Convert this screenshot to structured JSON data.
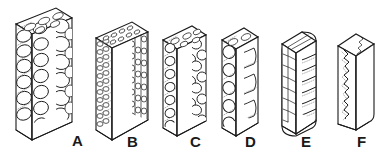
{
  "figure": {
    "type": "line-drawing-diagram",
    "background_color": "#ffffff",
    "ink_color": "#1a1a1a",
    "stipple_color": "#555555",
    "specimen_count": 6,
    "view": "isometric block"
  },
  "labels": [
    {
      "text": "A",
      "x": 72,
      "y": 133
    },
    {
      "text": "B",
      "x": 127,
      "y": 134
    },
    {
      "text": "C",
      "x": 190,
      "y": 134
    },
    {
      "text": "D",
      "x": 245,
      "y": 134
    },
    {
      "text": "E",
      "x": 301,
      "y": 134
    },
    {
      "text": "F",
      "x": 357,
      "y": 134
    }
  ],
  "specimens": [
    {
      "id": "A",
      "label": "A",
      "description": "coarse open-cell foam block, large irregular rounded cells",
      "cell_size": "largest",
      "relative_density": "lowest",
      "block": {
        "x": 16,
        "y": 8,
        "width": 56,
        "height": 122,
        "depth": 16
      }
    },
    {
      "id": "B",
      "label": "B",
      "description": "fine closed-cell block, dense small regular cells",
      "cell_size": "smallest",
      "relative_density": "high",
      "block": {
        "x": 96,
        "y": 22,
        "width": 46,
        "height": 108,
        "depth": 16
      }
    },
    {
      "id": "C",
      "label": "C",
      "description": "medium-cell foam block, rounded cells of moderate size",
      "cell_size": "medium",
      "relative_density": "medium",
      "block": {
        "x": 163,
        "y": 26,
        "width": 38,
        "height": 102,
        "depth": 14
      }
    },
    {
      "id": "D",
      "label": "D",
      "description": "narrow column with few very large cells stacked vertically",
      "cell_size": "large",
      "relative_density": "low",
      "block": {
        "x": 222,
        "y": 26,
        "width": 30,
        "height": 102,
        "depth": 14
      }
    },
    {
      "id": "E",
      "label": "E",
      "description": "banded block with horizontal layered ridges",
      "cell_size": "lamellar bands",
      "relative_density": "higher",
      "block": {
        "x": 282,
        "y": 32,
        "width": 28,
        "height": 94,
        "depth": 13
      }
    },
    {
      "id": "F",
      "label": "F",
      "description": "near-solid block with a single zigzag seam on the left face",
      "cell_size": "none",
      "relative_density": "highest",
      "block": {
        "x": 338,
        "y": 32,
        "width": 34,
        "height": 90,
        "depth": 13
      }
    }
  ]
}
